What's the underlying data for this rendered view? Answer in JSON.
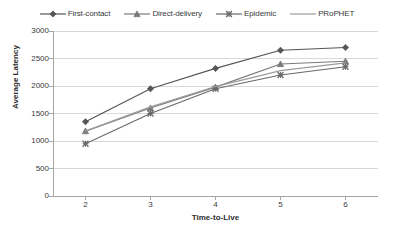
{
  "chart_data": {
    "type": "line",
    "title": "",
    "xlabel": "Time-to-Live",
    "ylabel": "Average Latency",
    "x": [
      2,
      3,
      4,
      5,
      6
    ],
    "xticklabels": [
      "2",
      "3",
      "4",
      "5",
      "6"
    ],
    "yticklabels": [
      "0",
      "500",
      "1000",
      "1500",
      "2000",
      "2500",
      "3000"
    ],
    "yticks": [
      0,
      500,
      1000,
      1500,
      2000,
      2500,
      3000
    ],
    "xlim": [
      1.5,
      6.5
    ],
    "ylim": [
      0,
      3000
    ],
    "grid": true,
    "grid_axis": "y",
    "legend_position": "top-center",
    "series": [
      {
        "name": "First-contact",
        "marker": "diamond",
        "color": "#555555",
        "values": [
          1350,
          1950,
          2320,
          2650,
          2700
        ]
      },
      {
        "name": "Direct-delivery",
        "marker": "triangle",
        "color": "#7a7a7a",
        "values": [
          1180,
          1600,
          1980,
          2400,
          2450
        ]
      },
      {
        "name": "Epidemic",
        "marker": "cross",
        "color": "#6a6a6a",
        "values": [
          950,
          1500,
          1950,
          2200,
          2350
        ]
      },
      {
        "name": "PRoPHET",
        "marker": "none",
        "color": "#9b9b9b",
        "values": [
          1180,
          1620,
          1990,
          2280,
          2420
        ]
      }
    ]
  },
  "axis": {
    "y_title": "Average Latency",
    "x_title": "Time-to-Live"
  },
  "colors": {
    "axis_line": "#a6a6a6",
    "grid_line": "#d9d9d9",
    "text": "#3a3a3a",
    "background": "#ffffff"
  }
}
